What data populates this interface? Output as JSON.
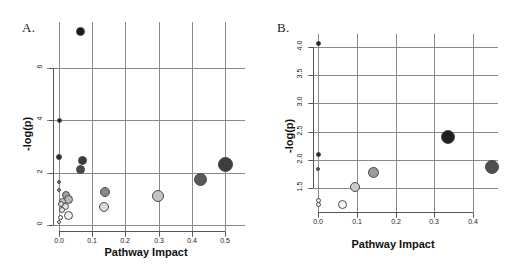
{
  "figure": {
    "panels": [
      {
        "id": "A",
        "label": "A.",
        "axis": {
          "xlabel": "Pathway Impact",
          "ylabel": "-log(p)",
          "xticks": [
            "0.0",
            "0.1",
            "0.2",
            "0.3",
            "0.4",
            "0.5"
          ],
          "yticks": [
            "0",
            "2",
            "4",
            "6"
          ],
          "xlim": [
            0.0,
            0.5
          ],
          "ylim": [
            0,
            6
          ]
        }
      },
      {
        "id": "B",
        "label": "B.",
        "axis": {
          "xlabel": "Pathway Impact",
          "ylabel": "-log(p)",
          "xticks": [
            "0.0",
            "0.1",
            "0.2",
            "0.3",
            "0.4"
          ],
          "yticks": [
            "1.5",
            "2.0",
            "2.5",
            "3.0",
            "3.5",
            "4.0"
          ],
          "xlim": [
            0.0,
            0.4
          ],
          "ylim": [
            1.5,
            4.0
          ]
        }
      }
    ]
  },
  "chart_data": [
    {
      "type": "scatter",
      "panel": "A",
      "title": "A.",
      "xlabel": "Pathway Impact",
      "ylabel": "-log(p)",
      "xlim": [
        0.0,
        0.5
      ],
      "ylim": [
        0,
        6
      ],
      "xticks": [
        0.0,
        0.1,
        0.2,
        0.3,
        0.4,
        0.5
      ],
      "yticks": [
        0,
        2,
        4,
        6
      ],
      "grid": true,
      "legend": "none",
      "note": "Bubble size encodes pathway impact magnitude; fill darkness encodes significance (darker = lower p).",
      "points": [
        {
          "x": 0.065,
          "y": 7.4,
          "size": 9,
          "color": "#1a1a1a"
        },
        {
          "x": 0.0,
          "y": 4.0,
          "size": 5,
          "color": "#262626"
        },
        {
          "x": 0.0,
          "y": 2.6,
          "size": 6,
          "color": "#2b2b2b"
        },
        {
          "x": 0.07,
          "y": 2.45,
          "size": 9,
          "color": "#3a3a3a"
        },
        {
          "x": 0.065,
          "y": 2.13,
          "size": 9,
          "color": "#474747"
        },
        {
          "x": 0.5,
          "y": 2.32,
          "size": 15,
          "color": "#3d3d3d"
        },
        {
          "x": 0.425,
          "y": 1.73,
          "size": 13,
          "color": "#595959"
        },
        {
          "x": 0.14,
          "y": 1.27,
          "size": 10,
          "color": "#8a8a8a"
        },
        {
          "x": 0.297,
          "y": 1.1,
          "size": 12,
          "color": "#c2c2c2"
        },
        {
          "x": 0.137,
          "y": 0.7,
          "size": 10,
          "color": "#d8d8d8"
        },
        {
          "x": 0.0,
          "y": 1.63,
          "size": 4,
          "color": "#7a7a7a"
        },
        {
          "x": 0.0,
          "y": 1.33,
          "size": 4,
          "color": "#8f8f8f"
        },
        {
          "x": 0.022,
          "y": 1.16,
          "size": 8,
          "color": "#a3a3a3"
        },
        {
          "x": 0.03,
          "y": 0.97,
          "size": 9,
          "color": "#b5b5b5"
        },
        {
          "x": 0.012,
          "y": 0.88,
          "size": 7,
          "color": "#c9c9c9"
        },
        {
          "x": 0.006,
          "y": 0.8,
          "size": 6,
          "color": "#dcdcdc"
        },
        {
          "x": 0.02,
          "y": 0.72,
          "size": 7,
          "color": "#e4e4e4"
        },
        {
          "x": 0.008,
          "y": 0.58,
          "size": 6,
          "color": "#ececec"
        },
        {
          "x": 0.03,
          "y": 0.38,
          "size": 9,
          "color": "#f2f2f2"
        },
        {
          "x": 0.005,
          "y": 0.3,
          "size": 5,
          "color": "#f5f5f5"
        },
        {
          "x": 0.0,
          "y": 0.12,
          "size": 4,
          "color": "#fafafa"
        }
      ]
    },
    {
      "type": "scatter",
      "panel": "B",
      "title": "B.",
      "xlabel": "Pathway Impact",
      "ylabel": "-log(p)",
      "xlim": [
        0.0,
        0.4
      ],
      "ylim": [
        1.15,
        4.15
      ],
      "xticks": [
        0.0,
        0.1,
        0.2,
        0.3,
        0.4
      ],
      "yticks": [
        1.5,
        2.0,
        2.5,
        3.0,
        3.5,
        4.0
      ],
      "grid": true,
      "legend": "none",
      "note": "Bubble size encodes pathway impact magnitude; fill darkness encodes significance (darker = lower p).",
      "points": [
        {
          "x": 0.0,
          "y": 4.05,
          "size": 5,
          "color": "#1f1f1f"
        },
        {
          "x": 0.0,
          "y": 2.1,
          "size": 5,
          "color": "#262626"
        },
        {
          "x": 0.0,
          "y": 1.83,
          "size": 4,
          "color": "#555555"
        },
        {
          "x": 0.335,
          "y": 2.4,
          "size": 14,
          "color": "#1f1f1f"
        },
        {
          "x": 0.448,
          "y": 1.88,
          "size": 14,
          "color": "#4f4f4f"
        },
        {
          "x": 0.143,
          "y": 1.78,
          "size": 11,
          "color": "#9a9a9a"
        },
        {
          "x": 0.095,
          "y": 1.52,
          "size": 10,
          "color": "#cccccc"
        },
        {
          "x": 0.0,
          "y": 1.28,
          "size": 5,
          "color": "#f0f0f0"
        },
        {
          "x": 0.0,
          "y": 1.22,
          "size": 5,
          "color": "#f5f5f5"
        },
        {
          "x": 0.063,
          "y": 1.22,
          "size": 9,
          "color": "#fbfbfb"
        }
      ]
    }
  ]
}
